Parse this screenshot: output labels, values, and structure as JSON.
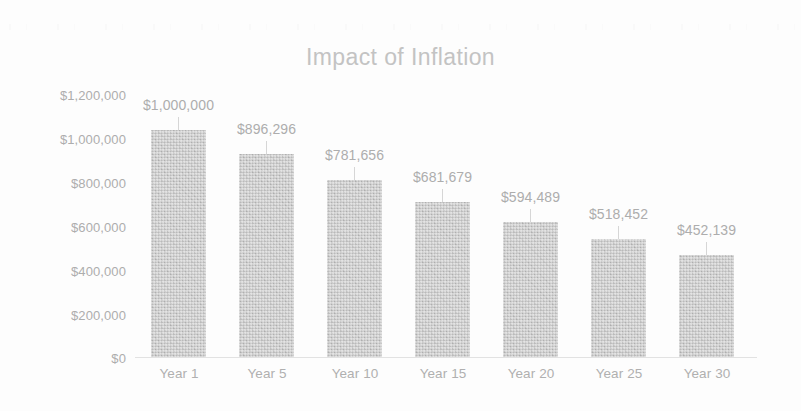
{
  "chart_data": {
    "type": "bar",
    "title": "Impact of Inflation",
    "xlabel": "",
    "ylabel": "",
    "categories": [
      "Year 1",
      "Year 5",
      "Year 10",
      "Year 15",
      "Year 20",
      "Year 25",
      "Year 30"
    ],
    "values": [
      1000000,
      896296,
      781656,
      681679,
      594489,
      518452,
      452139
    ],
    "value_labels": [
      "$1,000,000",
      "$896,296",
      "$781,656",
      "$681,679",
      "$594,489",
      "$518,452",
      "$452,139"
    ],
    "ylim": [
      0,
      1200000
    ],
    "ytick_values": [
      1200000,
      1000000,
      800000,
      600000,
      400000,
      200000,
      0
    ],
    "ytick_labels": [
      "$1,200,000",
      "$1,000,000",
      "$800,000",
      "$600,000",
      "$400,000",
      "$200,000",
      "$0"
    ],
    "grid": false,
    "legend": false,
    "series": [
      {
        "name": "Value",
        "values": [
          1000000,
          896296,
          781656,
          681679,
          594489,
          518452,
          452139
        ]
      }
    ],
    "colors": {
      "bar_fill": "#c6c6c6",
      "title_text": "#c3c3c3",
      "tick_text": "#adadad",
      "label_text": "#adadad",
      "axis_line": "#e2e2e2",
      "background": "#fdfdfd"
    }
  }
}
